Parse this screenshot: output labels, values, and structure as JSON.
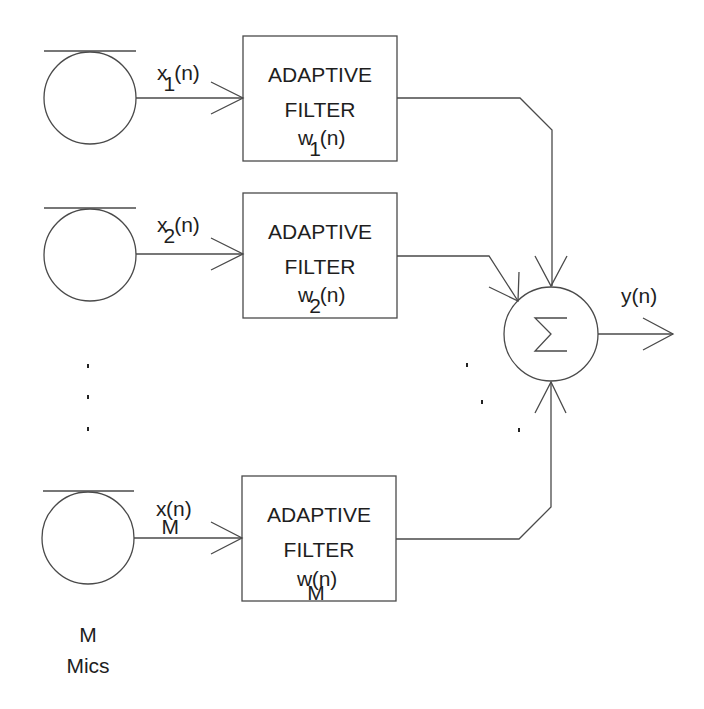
{
  "diagram": {
    "type": "adaptive-beamformer-block-diagram",
    "colors": {
      "stroke": "#4a4a4a",
      "text": "#1e1e1e",
      "background": "#ffffff"
    },
    "microphones": [
      {
        "id": "mic-1",
        "signal_label": "x",
        "signal_sub": "1",
        "signal_arg": "(n)"
      },
      {
        "id": "mic-2",
        "signal_label": "x",
        "signal_sub": "2",
        "signal_arg": "(n)"
      },
      {
        "id": "mic-M",
        "signal_label": "x",
        "signal_sub": "M",
        "signal_arg": "(n)"
      }
    ],
    "filters": [
      {
        "line1": "ADAPTIVE",
        "line2": "FILTER",
        "weight_label": "w",
        "weight_sub": "1",
        "weight_arg": "(n)"
      },
      {
        "line1": "ADAPTIVE",
        "line2": "FILTER",
        "weight_label": "w",
        "weight_sub": "2",
        "weight_arg": "(n)"
      },
      {
        "line1": "ADAPTIVE",
        "line2": "FILTER",
        "weight_label": "w",
        "weight_sub": "M",
        "weight_arg": "(n)"
      }
    ],
    "summer": {
      "symbol": "Σ"
    },
    "output": {
      "label": "y(n)"
    },
    "mics_caption": {
      "line1": "M",
      "line2": "Mics"
    },
    "ellipsis_left": "⋮",
    "ellipsis_right": "⋱"
  }
}
